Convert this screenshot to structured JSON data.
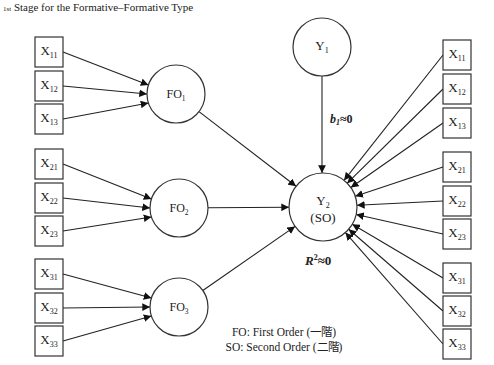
{
  "title": {
    "ordinal": "1st",
    "text": "Stage for the Formative–Formative Type"
  },
  "nodes": {
    "left_indicators": [
      {
        "id": "L_X11",
        "base": "X",
        "sub": "11",
        "x": 35,
        "y": 37
      },
      {
        "id": "L_X12",
        "base": "X",
        "sub": "12",
        "x": 35,
        "y": 71
      },
      {
        "id": "L_X13",
        "base": "X",
        "sub": "13",
        "x": 35,
        "y": 104
      },
      {
        "id": "L_X21",
        "base": "X",
        "sub": "21",
        "x": 35,
        "y": 149
      },
      {
        "id": "L_X22",
        "base": "X",
        "sub": "22",
        "x": 35,
        "y": 183
      },
      {
        "id": "L_X23",
        "base": "X",
        "sub": "23",
        "x": 35,
        "y": 216
      },
      {
        "id": "L_X31",
        "base": "X",
        "sub": "31",
        "x": 35,
        "y": 259
      },
      {
        "id": "L_X32",
        "base": "X",
        "sub": "32",
        "x": 35,
        "y": 293
      },
      {
        "id": "L_X33",
        "base": "X",
        "sub": "33",
        "x": 35,
        "y": 326
      }
    ],
    "right_indicators": [
      {
        "id": "R_X11",
        "base": "X",
        "sub": "11",
        "x": 443,
        "y": 40
      },
      {
        "id": "R_X12",
        "base": "X",
        "sub": "12",
        "x": 443,
        "y": 74
      },
      {
        "id": "R_X13",
        "base": "X",
        "sub": "13",
        "x": 443,
        "y": 108
      },
      {
        "id": "R_X21",
        "base": "X",
        "sub": "21",
        "x": 443,
        "y": 152
      },
      {
        "id": "R_X22",
        "base": "X",
        "sub": "22",
        "x": 443,
        "y": 186
      },
      {
        "id": "R_X23",
        "base": "X",
        "sub": "23",
        "x": 443,
        "y": 219
      },
      {
        "id": "R_X31",
        "base": "X",
        "sub": "31",
        "x": 443,
        "y": 263
      },
      {
        "id": "R_X32",
        "base": "X",
        "sub": "32",
        "x": 443,
        "y": 296
      },
      {
        "id": "R_X33",
        "base": "X",
        "sub": "33",
        "x": 443,
        "y": 329
      }
    ],
    "first_order": [
      {
        "id": "FO1",
        "base": "FO",
        "sub": "1",
        "cx": 176,
        "cy": 94,
        "r": 29
      },
      {
        "id": "FO2",
        "base": "FO",
        "sub": "2",
        "cx": 179,
        "cy": 208,
        "r": 29
      },
      {
        "id": "FO3",
        "base": "FO",
        "sub": "3",
        "cx": 179,
        "cy": 307,
        "r": 29
      }
    ],
    "y1": {
      "id": "Y1",
      "base": "Y",
      "sub": "1",
      "cx": 322,
      "cy": 47,
      "r": 29
    },
    "y2": {
      "id": "Y2",
      "base": "Y",
      "sub": "2",
      "line2": "(SO)",
      "cx": 323,
      "cy": 207,
      "r": 34
    }
  },
  "box_size": {
    "w": 28,
    "h": 30
  },
  "labels": {
    "path_b1": {
      "var": "b",
      "sub": "1",
      "rel": "≈",
      "val": "0"
    },
    "r_squared": {
      "var": "R",
      "sup": "2",
      "rel": "≈",
      "val": "0"
    }
  },
  "legend": {
    "line1": "FO: First Order (一階)",
    "line2": "SO: Second Order (二階)"
  },
  "edges_note": "Left X boxes → their FO circle; FO1/FO2/FO3 → Y2; Y1 → Y2; all right X boxes → Y2"
}
